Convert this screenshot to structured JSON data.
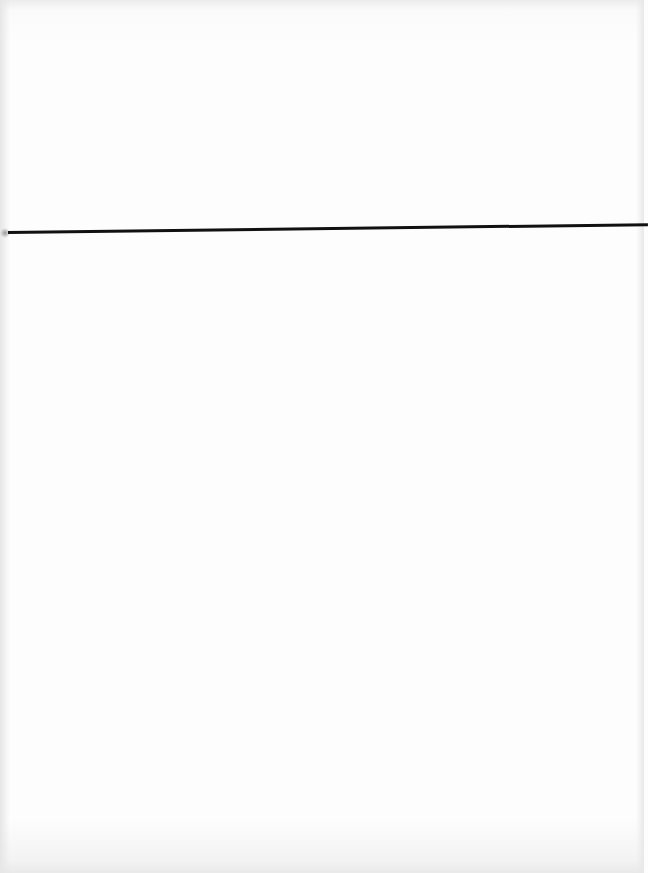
{
  "page": {
    "type": "scanned-blank-page",
    "background_color": "#fdfdfd",
    "rule_color": "#111111",
    "visible_text": []
  }
}
